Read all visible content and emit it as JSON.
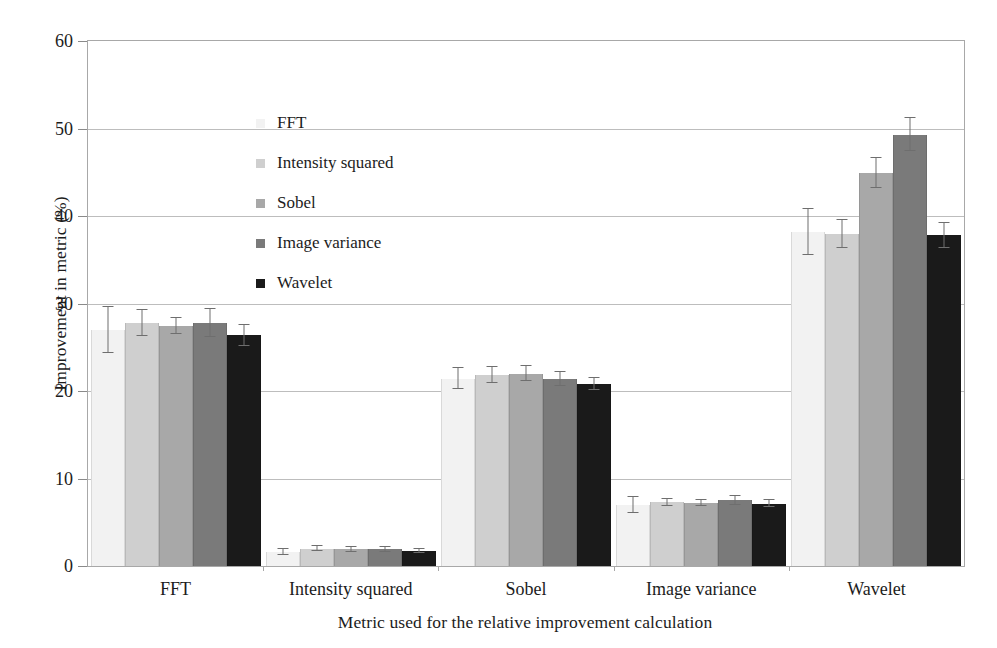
{
  "chart_data": {
    "type": "bar",
    "title": "",
    "xlabel": "Metric used for the relative improvement calculation",
    "ylabel": "Improvement in metric (%)",
    "categories": [
      "FFT",
      "Intensity squared",
      "Sobel",
      "Image variance",
      "Wavelet"
    ],
    "ylim": [
      0,
      60
    ],
    "yticks": [
      0,
      10,
      20,
      30,
      40,
      50,
      60
    ],
    "ytick_labels": [
      "0",
      "10",
      "20",
      "30",
      "40",
      "50",
      "60"
    ],
    "grid": true,
    "legend_position": "upper-left-inside",
    "series": [
      {
        "name": "FFT",
        "color": "#f2f2f2",
        "values": [
          27.0,
          1.6,
          21.4,
          7.0,
          38.2
        ],
        "errors": [
          2.6,
          0.35,
          1.2,
          0.9,
          2.6
        ]
      },
      {
        "name": "Intensity squared",
        "color": "#cfcfcf",
        "values": [
          27.8,
          2.0,
          21.8,
          7.3,
          37.9
        ],
        "errors": [
          1.5,
          0.3,
          0.9,
          0.4,
          1.6
        ]
      },
      {
        "name": "Sobel",
        "color": "#a8a8a8",
        "values": [
          27.4,
          1.9,
          22.0,
          7.2,
          44.9
        ],
        "errors": [
          0.9,
          0.25,
          0.9,
          0.35,
          1.7
        ]
      },
      {
        "name": "Image variance",
        "color": "#7a7a7a",
        "values": [
          27.8,
          1.9,
          21.4,
          7.5,
          49.3
        ],
        "errors": [
          1.6,
          0.25,
          0.8,
          0.5,
          1.9
        ]
      },
      {
        "name": "Wavelet",
        "color": "#1a1a1a",
        "values": [
          26.4,
          1.7,
          20.8,
          7.1,
          37.8
        ],
        "errors": [
          1.2,
          0.25,
          0.7,
          0.4,
          1.4
        ]
      }
    ]
  },
  "legend": {
    "items": [
      {
        "label": "FFT",
        "color": "#f2f2f2"
      },
      {
        "label": "Intensity squared",
        "color": "#cfcfcf"
      },
      {
        "label": "Sobel",
        "color": "#a8a8a8"
      },
      {
        "label": "Image variance",
        "color": "#7a7a7a"
      },
      {
        "label": "Wavelet",
        "color": "#1a1a1a"
      }
    ]
  },
  "axes": {
    "y_title": "Improvement in metric (%)",
    "x_title": "Metric used for the relative improvement calculation"
  }
}
